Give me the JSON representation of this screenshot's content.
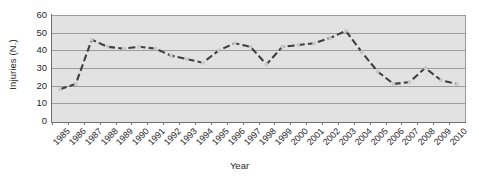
{
  "chart_data": {
    "type": "line",
    "title": "",
    "xlabel": "Year",
    "ylabel": "Injuries (N.)",
    "ylim": [
      0,
      60
    ],
    "yticks": [
      0,
      10,
      20,
      30,
      40,
      50,
      60
    ],
    "grid": true,
    "legend": "none",
    "line_style": "dashed",
    "marker": "square",
    "line_color": "#3f3f3f",
    "marker_color": "#c9c9c9",
    "plot_background": "#e2e2e2",
    "categories": [
      "1985",
      "1986",
      "1987",
      "1988",
      "1989",
      "1990",
      "1991",
      "1992",
      "1993",
      "1994",
      "1995",
      "1996",
      "1997",
      "1998",
      "1999",
      "2000",
      "2001",
      "2002",
      "2003",
      "2004",
      "2005",
      "2006",
      "2007",
      "2008",
      "2009",
      "2010"
    ],
    "values": [
      18,
      21,
      46,
      43,
      41,
      42,
      41,
      38,
      36,
      33,
      38,
      40,
      41,
      32,
      44,
      43,
      44,
      47,
      51,
      41,
      30,
      21,
      21,
      25,
      30,
      22
    ],
    "series": [
      {
        "name": "Injuries (N.)",
        "values": [
          18,
          21,
          46,
          42,
          41,
          42,
          41,
          37,
          35,
          33,
          40,
          44,
          42,
          32,
          42,
          43,
          44,
          47,
          51,
          39,
          28,
          21,
          22,
          30,
          23,
          21
        ]
      }
    ]
  }
}
